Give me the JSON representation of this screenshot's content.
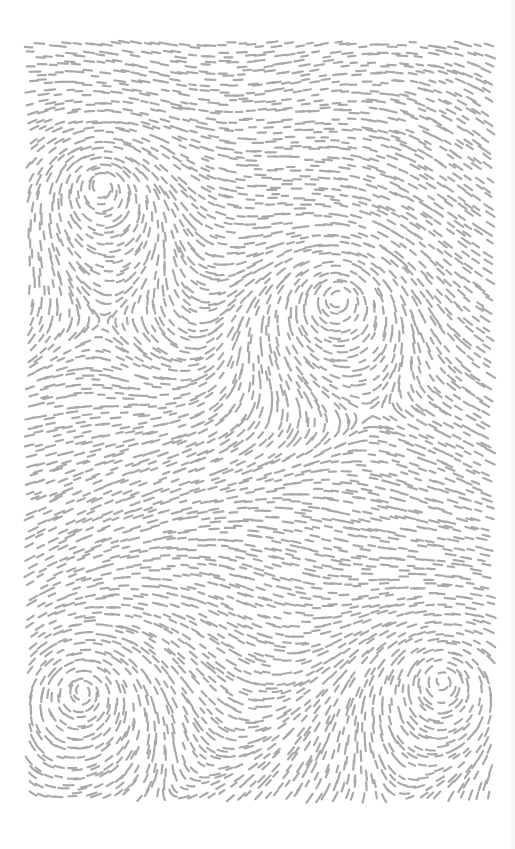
{
  "artwork": {
    "title": "",
    "background_color": "#ffffff",
    "stroke_color": "#a9a9a9",
    "bounds": {
      "x": 27,
      "y": 40,
      "width": 466,
      "height": 762
    },
    "grid_spacing": 9.5,
    "dash_length": 9,
    "dash_width": 2.2,
    "vortices": [
      {
        "name": "top-left",
        "x": 100,
        "y": 185,
        "strength": 1.0
      },
      {
        "name": "middle-right",
        "x": 338,
        "y": 298,
        "strength": 1.0
      },
      {
        "name": "bottom-left",
        "x": 82,
        "y": 690,
        "strength": 1.0
      },
      {
        "name": "bottom-right",
        "x": 442,
        "y": 680,
        "strength": 1.0
      }
    ]
  },
  "caption": ""
}
